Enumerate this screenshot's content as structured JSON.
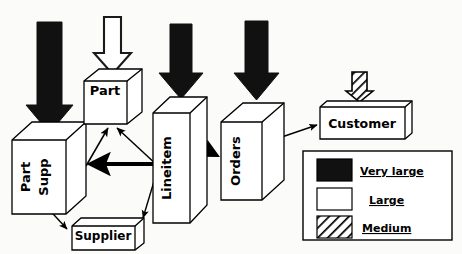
{
  "diagram": {
    "type": "entity-size-diagram",
    "background_color": "#fbfbfa",
    "stroke_color": "#000000",
    "fill_color": "#ffffff",
    "entities": [
      {
        "id": "part-supp",
        "label_line1": "Part",
        "label_line2": "Supp",
        "orientation": "vertical",
        "shape": "cube-tall"
      },
      {
        "id": "part",
        "label_line1": "Part",
        "label_line2": "",
        "orientation": "horizontal",
        "shape": "cube"
      },
      {
        "id": "supplier",
        "label_line1": "Supplier",
        "label_line2": "",
        "orientation": "horizontal",
        "shape": "slab"
      },
      {
        "id": "lineitem",
        "label_line1": "Lineitem",
        "label_line2": "",
        "orientation": "vertical",
        "shape": "cube-tall"
      },
      {
        "id": "orders",
        "label_line1": "Orders",
        "label_line2": "",
        "orientation": "vertical",
        "shape": "cube-tall"
      },
      {
        "id": "customer",
        "label_line1": "Customer",
        "label_line2": "",
        "orientation": "horizontal",
        "shape": "slab"
      }
    ],
    "size_arrows": [
      {
        "target": "part-supp",
        "size": "Very large",
        "fill": "solid-black"
      },
      {
        "target": "part",
        "size": "Large",
        "fill": "white"
      },
      {
        "target": "lineitem",
        "size": "Very large",
        "fill": "solid-black"
      },
      {
        "target": "orders",
        "size": "Very large",
        "fill": "solid-black"
      },
      {
        "target": "customer",
        "size": "Medium",
        "fill": "hatched"
      }
    ],
    "connectors": [
      {
        "from": "part-supp",
        "to": "part",
        "weight": "thin"
      },
      {
        "from": "lineitem",
        "to": "part",
        "weight": "thin"
      },
      {
        "from": "lineitem",
        "to": "part-supp",
        "weight": "thick"
      },
      {
        "from": "part-supp",
        "to": "supplier",
        "weight": "thin"
      },
      {
        "from": "lineitem",
        "to": "supplier",
        "weight": "thin"
      },
      {
        "from": "lineitem",
        "to": "orders",
        "weight": "thick-short"
      },
      {
        "from": "orders",
        "to": "customer",
        "weight": "thin"
      }
    ],
    "legend": {
      "items": [
        {
          "label": "Very large",
          "swatch": "solid-black"
        },
        {
          "label": "Large",
          "swatch": "white"
        },
        {
          "label": "Medium",
          "swatch": "hatched"
        }
      ]
    }
  }
}
